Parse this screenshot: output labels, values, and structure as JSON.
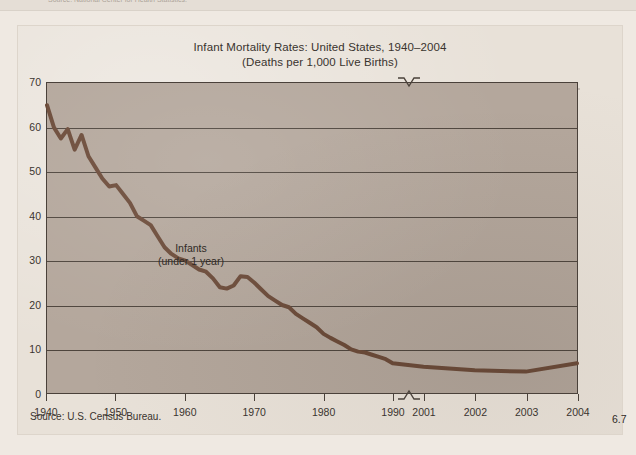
{
  "page": {
    "background_color": "#efe9e2",
    "card_background_color": "#e8e1d8",
    "previous_figure_source_fragment": "Source: National Center for Health Statistics."
  },
  "chart_data": {
    "type": "line",
    "title": "Infant Mortality Rates: United States, 1940–2004",
    "subtitle": "(Deaths per 1,000 Live Births)",
    "xlabel": "",
    "ylabel": "",
    "ylim": [
      0,
      70
    ],
    "ytick_step": 10,
    "grid": true,
    "legend": "none",
    "line_color": "#6b4a38",
    "plot_background_color": "#b4a79c",
    "axis_color": "#4a413a",
    "axis_break": {
      "present": true,
      "between": [
        "1990",
        "2001"
      ],
      "marker": "caret",
      "note": "x-axis is broken; 1940–1990 shown by decade, 2001–2004 shown annually"
    },
    "yticks": [
      "70",
      "60",
      "50",
      "40",
      "30",
      "20",
      "10",
      "0"
    ],
    "xticks": [
      "1940",
      "1950",
      "1960",
      "1970",
      "1980",
      "1990",
      "2001",
      "2002",
      "2003",
      "2004"
    ],
    "annotations": [
      {
        "name": "series-label",
        "lines": [
          "Infants",
          "(under 1 year)"
        ]
      },
      {
        "name": "endpoint-value",
        "text": "6.7"
      }
    ],
    "series": [
      {
        "name": "Infants (under 1 year)",
        "x": [
          1940,
          1941,
          1942,
          1943,
          1944,
          1945,
          1946,
          1947,
          1948,
          1949,
          1950,
          1951,
          1952,
          1953,
          1954,
          1955,
          1956,
          1957,
          1958,
          1959,
          1960,
          1961,
          1962,
          1963,
          1964,
          1965,
          1966,
          1967,
          1968,
          1969,
          1970,
          1971,
          1972,
          1973,
          1974,
          1975,
          1976,
          1977,
          1978,
          1979,
          1980,
          1981,
          1982,
          1983,
          1984,
          1985,
          1986,
          1987,
          1988,
          1989,
          1990,
          2001,
          2002,
          2003,
          2004
        ],
        "values": [
          65.0,
          60.0,
          57.5,
          59.6,
          55.0,
          58.3,
          53.5,
          51.0,
          48.5,
          46.7,
          47.0,
          45.0,
          43.0,
          40.0,
          39.0,
          38.0,
          35.5,
          33.0,
          31.5,
          30.5,
          30.0,
          29.0,
          28.0,
          27.5,
          26.0,
          24.0,
          23.7,
          24.4,
          26.5,
          26.3,
          25.0,
          23.5,
          22.0,
          21.0,
          20.0,
          19.5,
          18.0,
          17.0,
          16.0,
          15.0,
          13.5,
          12.6,
          11.8,
          11.0,
          10.0,
          9.5,
          9.3,
          8.8,
          8.3,
          7.8,
          6.9,
          6.1,
          5.3,
          5.0,
          6.9
        ],
        "end_value": 6.7
      }
    ]
  },
  "source_note": "Source: U.S. Census Bureau."
}
